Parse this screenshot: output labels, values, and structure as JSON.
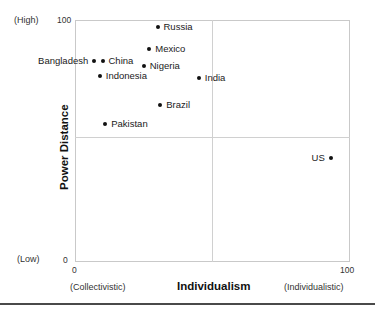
{
  "chart_data": {
    "type": "scatter",
    "title": "",
    "xlabel": "Individualism",
    "ylabel": "Power Distance",
    "xlim": [
      0,
      100
    ],
    "ylim": [
      0,
      100
    ],
    "grid": true,
    "legend": "none",
    "x_axis": {
      "title": "Individualism",
      "ticks": [
        "0",
        "100"
      ],
      "tick_values": [
        0,
        100
      ],
      "low_end_label": "(Collectivistic)",
      "high_end_label": "(Individualistic)",
      "crosshair_at": 50
    },
    "y_axis": {
      "title": "Power Distance",
      "ticks": [
        "0",
        "100"
      ],
      "tick_values": [
        0,
        100
      ],
      "low_end_label": "(Low)",
      "high_end_label": "(High)",
      "crosshair_at": 50
    },
    "point_color": "#111111",
    "points": [
      {
        "label": "Russia",
        "x": 30,
        "y": 97,
        "label_side": "right"
      },
      {
        "label": "Mexico",
        "x": 27,
        "y": 88,
        "label_side": "right"
      },
      {
        "label": "Bangladesh",
        "x": 7,
        "y": 83,
        "label_side": "left"
      },
      {
        "label": "China",
        "x": 10,
        "y": 83,
        "label_side": "right"
      },
      {
        "label": "Nigeria",
        "x": 25,
        "y": 81,
        "label_side": "right"
      },
      {
        "label": "Indonesia",
        "x": 9,
        "y": 77,
        "label_side": "right"
      },
      {
        "label": "India",
        "x": 45,
        "y": 76,
        "label_side": "right"
      },
      {
        "label": "Brazil",
        "x": 31,
        "y": 65,
        "label_side": "right"
      },
      {
        "label": "Pakistan",
        "x": 11,
        "y": 57,
        "label_side": "right"
      },
      {
        "label": "US",
        "x": 93,
        "y": 43,
        "label_side": "left"
      }
    ]
  }
}
